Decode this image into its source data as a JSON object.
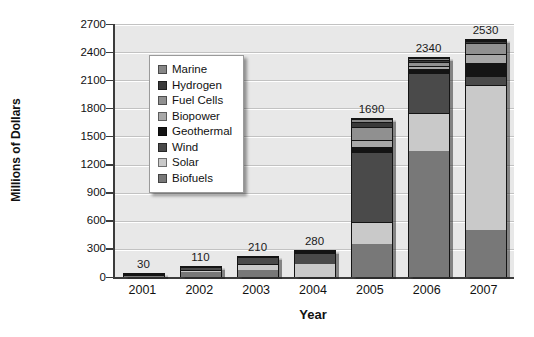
{
  "chart_data": {
    "type": "bar",
    "variant": "stacked",
    "title": "",
    "xlabel": "Year",
    "ylabel": "Millions of Dollars",
    "ylim": [
      0,
      2700
    ],
    "yticks": [
      0,
      300,
      600,
      900,
      1200,
      1500,
      1800,
      2100,
      2400,
      2700
    ],
    "grid": "horizontal",
    "legend_position": "inside-upper-left",
    "plot_background": "#e8e8e8",
    "categories": [
      "2001",
      "2002",
      "2003",
      "2004",
      "2005",
      "2006",
      "2007"
    ],
    "totals": [
      30,
      110,
      210,
      280,
      1690,
      2340,
      2530
    ],
    "stack_order_bottom_to_top": [
      "Biofuels",
      "Solar",
      "Wind",
      "Geothermal",
      "Biopower",
      "Fuel Cells",
      "Hydrogen",
      "Marine"
    ],
    "series": [
      {
        "name": "Marine",
        "color": "#878787",
        "values": [
          0,
          0,
          0,
          0,
          30,
          20,
          10
        ]
      },
      {
        "name": "Hydrogen",
        "color": "#3a3a3a",
        "values": [
          0,
          0,
          0,
          0,
          60,
          20,
          20
        ]
      },
      {
        "name": "Fuel Cells",
        "color": "#909090",
        "values": [
          0,
          0,
          0,
          0,
          140,
          50,
          120
        ]
      },
      {
        "name": "Biopower",
        "color": "#a8a8a8",
        "values": [
          0,
          0,
          0,
          0,
          75,
          30,
          100
        ]
      },
      {
        "name": "Geothermal",
        "color": "#141414",
        "values": [
          0,
          0,
          0,
          20,
          55,
          40,
          130
        ]
      },
      {
        "name": "Wind",
        "color": "#4a4a4a",
        "values": [
          10,
          40,
          70,
          120,
          740,
          430,
          100
        ]
      },
      {
        "name": "Solar",
        "color": "#c9c9c9",
        "values": [
          10,
          20,
          70,
          140,
          240,
          400,
          1550
        ]
      },
      {
        "name": "Biofuels",
        "color": "#787878",
        "values": [
          10,
          50,
          70,
          0,
          350,
          1350,
          500
        ]
      }
    ]
  }
}
